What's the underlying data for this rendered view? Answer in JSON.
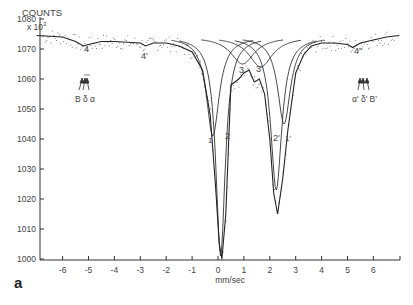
{
  "figure_label": "a",
  "chart_data": {
    "type": "line",
    "title": "",
    "ylabel": "COUNTS",
    "ylabel_multiplier": "x 10",
    "ylabel_exponent": "3",
    "xlabel": "mm/sec",
    "xlim": [
      -7,
      7
    ],
    "ylim": [
      1000,
      1080
    ],
    "x_ticks": [
      -6,
      -5,
      -4,
      -3,
      -2,
      -1,
      0,
      1,
      2,
      3,
      4,
      5,
      6
    ],
    "x_tick_labels": [
      "-6",
      "-5",
      "-4",
      "-3",
      "-2",
      "-1",
      "0",
      "1",
      "2",
      "3",
      "4",
      "5",
      "6"
    ],
    "y_ticks": [
      1000,
      1010,
      1020,
      1030,
      1040,
      1050,
      1060,
      1070,
      1080
    ],
    "y_tick_labels": [
      "1000",
      "1010",
      "1020",
      "1030",
      "1040",
      "1050",
      "1060",
      "1070",
      "1080"
    ],
    "grid": false,
    "legend": null,
    "series": [
      {
        "name": "fitted spectrum (envelope)",
        "x": [
          -7,
          -6,
          -5.5,
          -5.2,
          -5,
          -4.5,
          -4,
          -3,
          -2.8,
          -2.5,
          -2,
          -1.5,
          -1,
          -0.6,
          -0.3,
          -0.1,
          0.05,
          0.15,
          0.3,
          0.5,
          0.8,
          1.0,
          1.2,
          1.4,
          1.6,
          1.8,
          2.0,
          2.15,
          2.3,
          2.5,
          2.7,
          3.0,
          3.3,
          3.6,
          4,
          4.5,
          5,
          5.2,
          5.5,
          6,
          6.5,
          7
        ],
        "y": [
          1074.5,
          1074,
          1072.5,
          1071,
          1071.5,
          1072.5,
          1072.5,
          1072,
          1071,
          1072,
          1072,
          1071,
          1069,
          1063,
          1048,
          1025,
          1005,
          1000,
          1015,
          1058,
          1060,
          1062,
          1063,
          1059,
          1060,
          1055,
          1040,
          1022,
          1015,
          1027,
          1043,
          1062,
          1068,
          1071,
          1072,
          1072,
          1071.5,
          1070.5,
          1072,
          1073,
          1074,
          1074.5
        ]
      },
      {
        "name": "component 1 (doublet, lines 1 and 1')",
        "peaks_x": [
          -0.2,
          2.55
        ],
        "peaks_y": [
          1041,
          1045
        ],
        "labels": [
          "1",
          "1'"
        ]
      },
      {
        "name": "component 2 (doublet, lines 2 and 2')",
        "peaks_x": [
          0.1,
          2.25
        ],
        "peaks_y": [
          1001,
          1023
        ],
        "labels": [
          "2",
          "2'"
        ]
      },
      {
        "name": "component 3 (doublet, lines 3 and 3')",
        "peaks_x": [
          0.95,
          1.65
        ],
        "peaks_y": [
          1065,
          1064
        ],
        "labels": [
          "3",
          "3'"
        ]
      },
      {
        "name": "component 4 (sextet outer lines 4, 4', 4'')",
        "peaks_x": [
          -5.1,
          -2.9,
          5.2
        ],
        "peaks_y": [
          1071,
          1071.5,
          1071
        ],
        "labels": [
          "4",
          "4'",
          "4''"
        ]
      }
    ],
    "annotations": [
      {
        "text": "4",
        "x": -5.1,
        "y": 1075
      },
      {
        "text": "4'",
        "x": -2.9,
        "y": 1075
      },
      {
        "text": "4''",
        "x": 5.3,
        "y": 1075
      },
      {
        "text": "1",
        "x": -0.35,
        "y": 1048
      },
      {
        "text": "2",
        "x": 0.55,
        "y": 1047
      },
      {
        "text": "3",
        "x": 0.9,
        "y": 1068
      },
      {
        "text": "3'",
        "x": 1.65,
        "y": 1068
      },
      {
        "text": "2'",
        "x": 2.2,
        "y": 1047
      },
      {
        "text": "1'",
        "x": 2.65,
        "y": 1047
      },
      {
        "text": "B δ α",
        "x": -5.1,
        "y": 1059,
        "note": "arrows pointing up at left outer lines"
      },
      {
        "text": "α' δ' B'",
        "x": 5.2,
        "y": 1059,
        "note": "arrows pointing up at right outer lines"
      }
    ]
  },
  "axis_text": {
    "y_title": "COUNTS",
    "y_mult": "x 10",
    "y_exp": "3",
    "x_title": "mm/sec"
  },
  "peak_labels": {
    "p4": "4",
    "p4p": "4'",
    "p4pp": "4''",
    "p1": "1",
    "p2": "2",
    "p3": "3",
    "p3p": "3'",
    "p2p": "2'",
    "p1p": "1'",
    "left_arrows": "B δ α",
    "right_arrows": "α' δ' B'"
  }
}
